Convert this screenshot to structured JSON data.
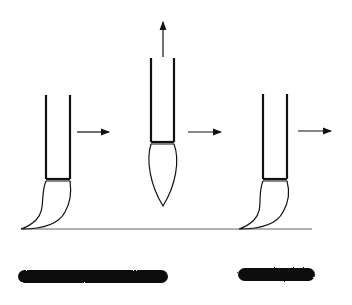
{
  "diagram": {
    "colors": {
      "ink": "#111111",
      "line": "#555555",
      "background": "#ffffff"
    },
    "stages": [
      {
        "name": "press",
        "direction": "right"
      },
      {
        "name": "lift",
        "direction": "up-right"
      },
      {
        "name": "press-again",
        "direction": "right"
      }
    ],
    "strokes": [
      {
        "name": "long-stroke"
      },
      {
        "name": "short-stroke"
      }
    ]
  }
}
